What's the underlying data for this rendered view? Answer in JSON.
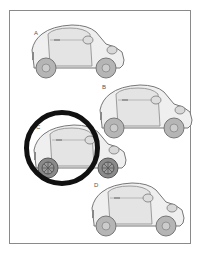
{
  "puzzle": {
    "type": "odd-one-out",
    "options": [
      {
        "label": "A",
        "wheel_style": "plain",
        "selected": false
      },
      {
        "label": "B",
        "wheel_style": "plain",
        "selected": false
      },
      {
        "label": "C",
        "wheel_style": "patterned-dark",
        "selected": true
      },
      {
        "label": "D",
        "wheel_style": "plain",
        "selected": false
      }
    ],
    "highlight_color": "#111111",
    "car_body_color": "#efefef",
    "wheel_color": "#b5b5b5",
    "outline_color": "#777777"
  }
}
